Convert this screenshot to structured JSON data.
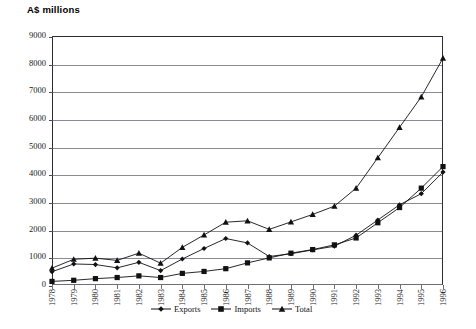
{
  "chart_data": {
    "type": "line",
    "title": "A$ millions",
    "xlabel": "",
    "ylabel": "A$ millions",
    "ylim": [
      0,
      9000
    ],
    "ytick_step": 1000,
    "grid": true,
    "legend_position": "bottom",
    "categories": [
      "1978",
      "1979",
      "1980",
      "1981",
      "1982",
      "1983",
      "1984",
      "1985",
      "1986",
      "1987",
      "1988",
      "1989",
      "1990",
      "1991",
      "1992",
      "1993",
      "1994",
      "1995",
      "1996"
    ],
    "yticks": [
      "0",
      "1000",
      "2000",
      "3000",
      "4000",
      "5000",
      "6000",
      "7000",
      "8000",
      "9000"
    ],
    "series": [
      {
        "name": "Exports",
        "marker": "diamond",
        "values": [
          480,
          760,
          740,
          620,
          820,
          520,
          940,
          1320,
          1680,
          1520,
          1030,
          1130,
          1270,
          1400,
          1800,
          2350,
          2900,
          3300,
          4080
        ]
      },
      {
        "name": "Imports",
        "marker": "square",
        "values": [
          130,
          170,
          230,
          270,
          330,
          270,
          420,
          490,
          590,
          800,
          980,
          1150,
          1280,
          1450,
          1700,
          2250,
          2800,
          3500,
          4280
        ]
      },
      {
        "name": "Total",
        "marker": "triangle",
        "values": [
          610,
          930,
          970,
          890,
          1150,
          790,
          1360,
          1810,
          2270,
          2320,
          2010,
          2280,
          2550,
          2850,
          3500,
          4600,
          5700,
          6800,
          8200
        ]
      }
    ]
  },
  "legend": {
    "items": [
      {
        "label": "Exports",
        "marker": "diamond"
      },
      {
        "label": "Imports",
        "marker": "square"
      },
      {
        "label": "Total",
        "marker": "triangle"
      }
    ]
  }
}
